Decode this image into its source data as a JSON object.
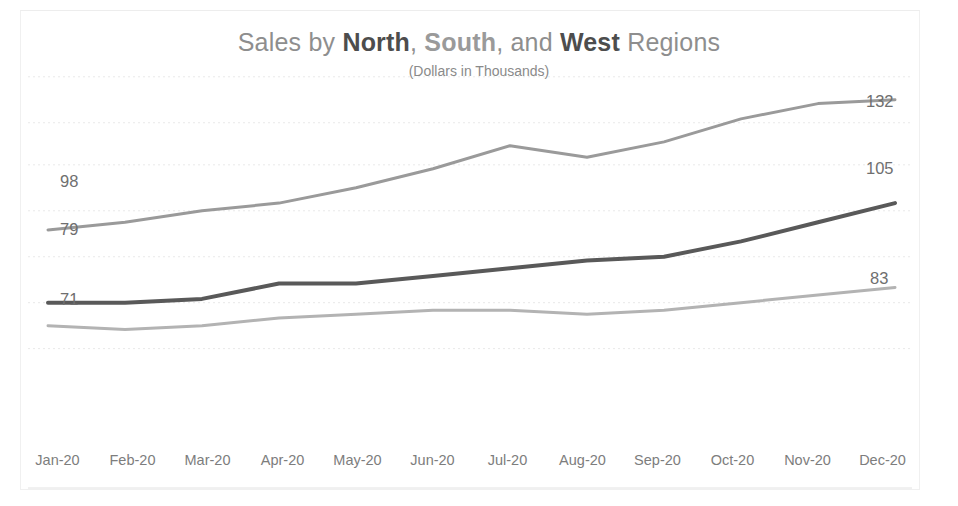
{
  "chart_data": {
    "type": "line",
    "title": "Sales by North, South, and West Regions",
    "title_parts": [
      {
        "text": "Sales by ",
        "style": "normal"
      },
      {
        "text": "North",
        "style": "bold-dark"
      },
      {
        "text": ", ",
        "style": "normal"
      },
      {
        "text": "South",
        "style": "bold-mid"
      },
      {
        "text": ", and ",
        "style": "normal"
      },
      {
        "text": "West",
        "style": "bold-dark"
      },
      {
        "text": " Regions",
        "style": "normal"
      }
    ],
    "subtitle": "(Dollars in Thousands)",
    "xlabel": "",
    "ylabel": "",
    "categories": [
      "Jan-20",
      "Feb-20",
      "Mar-20",
      "Apr-20",
      "May-20",
      "Jun-20",
      "Jul-20",
      "Aug-20",
      "Sep-20",
      "Oct-20",
      "Nov-20",
      "Dec-20"
    ],
    "ylim": [
      40,
      145
    ],
    "grid": true,
    "legend": "none",
    "series": [
      {
        "name": "South",
        "color": "#9a9a9a",
        "width": 3,
        "start_label": "98",
        "end_label": "132",
        "values": [
          98,
          100,
          103,
          105,
          109,
          114,
          120,
          117,
          121,
          127,
          131,
          132
        ]
      },
      {
        "name": "North",
        "color": "#595959",
        "width": 4,
        "start_label": "79",
        "end_label": "105",
        "values": [
          79,
          79,
          80,
          84,
          84,
          86,
          88,
          90,
          91,
          95,
          100,
          105
        ]
      },
      {
        "name": "West",
        "color": "#b3b3b3",
        "width": 3,
        "start_label": "71",
        "end_label": "83",
        "values": [
          73,
          72,
          73,
          75,
          76,
          77,
          77,
          76,
          77,
          79,
          81,
          83
        ]
      }
    ],
    "gridline_values": [
      138,
      126,
      115,
      103,
      91,
      79,
      67
    ],
    "endpoint_labels": {
      "left": [
        "98",
        "79",
        "71"
      ],
      "right": [
        "132",
        "105",
        "83"
      ]
    },
    "colors": {
      "background": "#ffffff",
      "grid": "#e9e9e9",
      "axis_text": "#7d7d7d",
      "title_light": "#8e8e8e",
      "title_dark": "#4d4d4d"
    }
  }
}
